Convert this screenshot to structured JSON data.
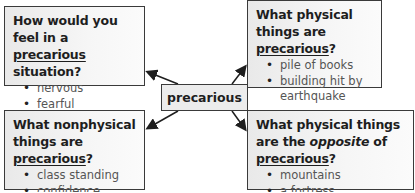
{
  "center": {
    "label": "precarious"
  },
  "boxes": {
    "top_left": {
      "question_pre": "How would you feel in a ",
      "question_word": "precarious",
      "question_post": " situation?",
      "items": [
        "nervous",
        "fearful"
      ]
    },
    "top_right": {
      "question_pre": "What physical things are ",
      "question_word": "precarious",
      "question_post": "?",
      "items": [
        "pile of books",
        "building hit by earthquake"
      ]
    },
    "bottom_left": {
      "question_pre": "What nonphysical things are ",
      "question_word": "precarious",
      "question_post": "?",
      "items": [
        "class standing",
        "confidence"
      ]
    },
    "bottom_right": {
      "question_pre": "What physical things are the ",
      "question_emph": "opposite",
      "question_mid": " of ",
      "question_word": "precarious",
      "question_post": "?",
      "items": [
        "mountains",
        "a fortress"
      ]
    }
  },
  "colors": {
    "border": "#3a3a3a",
    "box_fill": "#f0f0f0",
    "text": "#1e1e1e",
    "item_text": "#555555"
  }
}
